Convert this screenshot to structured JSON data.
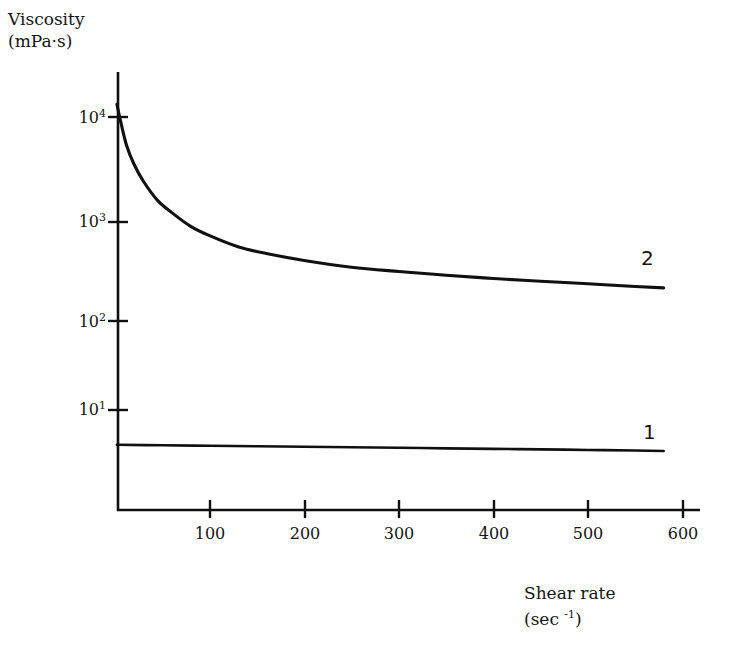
{
  "chart_data": {
    "type": "line",
    "title": "",
    "xlabel": "Shear rate (sec -1)",
    "ylabel": "Viscosity (mPa·s)",
    "yscale": "log",
    "xscale": "linear",
    "xlim": [
      0,
      640
    ],
    "ylim": [
      1,
      30000
    ],
    "grid": false,
    "legend": "inline-end-labels",
    "xticks": [
      100,
      200,
      300,
      400,
      500,
      600
    ],
    "xtick_labels": [
      "100",
      "200",
      "300",
      "400",
      "500",
      "600"
    ],
    "yticks": [
      10,
      100,
      1000,
      10000
    ],
    "ytick_labels": [
      "10 1",
      "10 2",
      "10 3",
      "10 4"
    ],
    "ytick_mantissa": [
      "10",
      "10",
      "10",
      "10"
    ],
    "ytick_exponents": [
      "1",
      "2",
      "3",
      "4"
    ],
    "series": [
      {
        "name": "1",
        "label": "1",
        "x": [
          2,
          50,
          100,
          150,
          200,
          250,
          300,
          350,
          400,
          450,
          500,
          550,
          580
        ],
        "values": [
          4.4,
          4.35,
          4.3,
          4.25,
          4.2,
          4.15,
          4.1,
          4.05,
          4.0,
          3.95,
          3.9,
          3.85,
          3.8
        ]
      },
      {
        "name": "2",
        "label": "2",
        "x": [
          2,
          6,
          12,
          20,
          30,
          45,
          60,
          80,
          100,
          130,
          160,
          200,
          250,
          300,
          350,
          400,
          450,
          500,
          550,
          580
        ],
        "values": [
          13500,
          9000,
          5200,
          3300,
          2200,
          1400,
          1050,
          760,
          610,
          470,
          400,
          340,
          290,
          262,
          240,
          222,
          208,
          196,
          184,
          178
        ]
      }
    ]
  },
  "axis_titles": {
    "y_line1": "Viscosity",
    "y_line2": "(mPa·s)",
    "x_line1": "Shear rate",
    "x_line2_prefix": "(sec ",
    "x_line2_exponent": "-1",
    "x_line2_suffix": ")"
  },
  "series_labels": {
    "upper": "2",
    "lower": "1"
  },
  "ytick_labels": [
    {
      "mantissa": "10",
      "exponent": "4"
    },
    {
      "mantissa": "10",
      "exponent": "3"
    },
    {
      "mantissa": "10",
      "exponent": "2"
    },
    {
      "mantissa": "10",
      "exponent": "1"
    }
  ],
  "xtick_labels": [
    "100",
    "200",
    "300",
    "400",
    "500",
    "600"
  ],
  "colors": {
    "ink": "#141414",
    "background": "#ffffff",
    "curve": "#101010",
    "axis": "#101010"
  }
}
